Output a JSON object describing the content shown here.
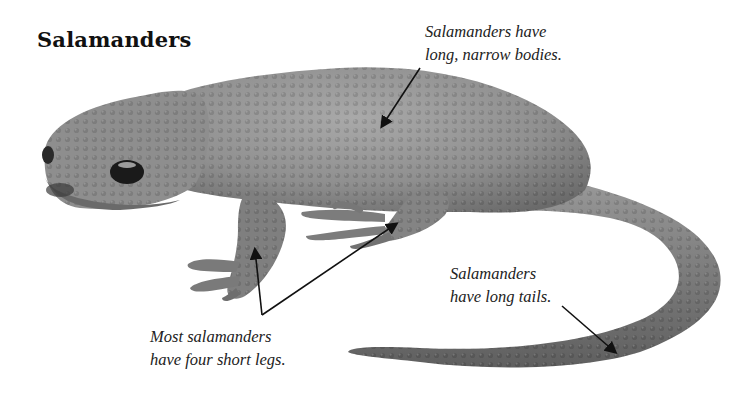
{
  "title": "Salamanders",
  "captions": {
    "body": [
      "Salamanders have",
      "long, narrow bodies."
    ],
    "legs": [
      "Most salamanders",
      "have four short legs."
    ],
    "tail": [
      "Salamanders",
      "have long tails."
    ]
  },
  "illustration": {
    "subject": "salamander photograph (grayscale)",
    "colors": {
      "skin_light": "#a8a8a8",
      "skin_mid": "#8a8a8a",
      "skin_dark": "#5e5e5e",
      "eye": "#1a1a1a",
      "arrow": "#111111",
      "background": "#ffffff"
    }
  }
}
